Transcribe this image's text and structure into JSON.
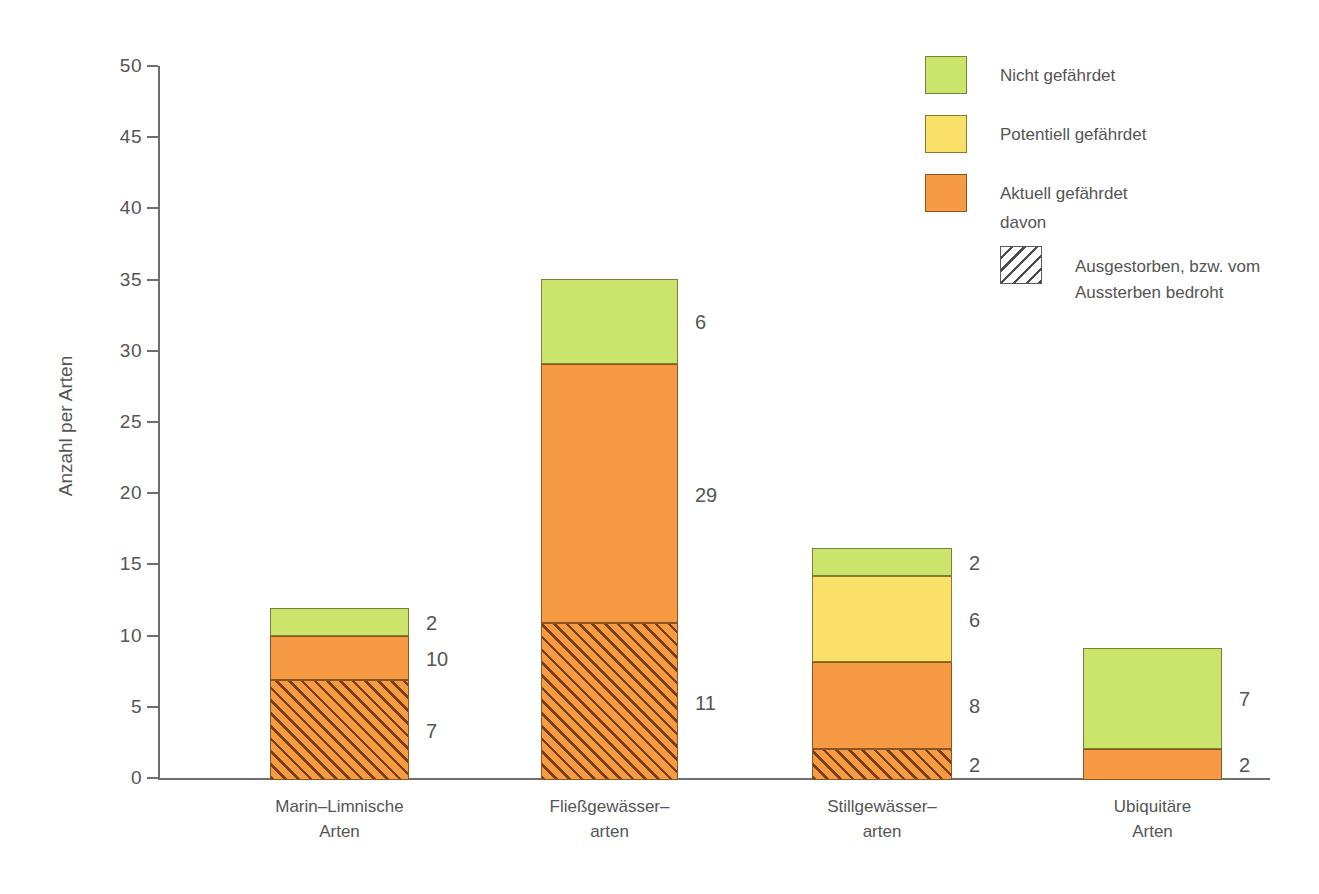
{
  "chart_data": {
    "type": "bar",
    "subtype": "stacked",
    "title": "",
    "xlabel": "",
    "ylabel": "Anzahl per Arten",
    "ylim": [
      0,
      50
    ],
    "ytick_step": 5,
    "yticks": [
      "50",
      "45",
      "40",
      "35",
      "30",
      "25",
      "20",
      "15",
      "10",
      "5",
      "0"
    ],
    "grid": false,
    "legend_position": "top-right",
    "categories": [
      "Marin–Limnische Arten",
      "Fließgewässer-arten",
      "Stillgewässer-arten",
      "Ubiquitäre Arten"
    ],
    "category_lines": [
      [
        "Marin–Limnische",
        "Arten"
      ],
      [
        "Fließgewässer–",
        "arten"
      ],
      [
        "Stillgewässer–",
        "arten"
      ],
      [
        "Ubiquitäre",
        "Arten"
      ]
    ],
    "series": [
      {
        "name": "Aktuell gefährdet, davon ausgestorben bzw. vom Aussterben bedroht",
        "key": "orange-hatched",
        "values": [
          7,
          11,
          2.2,
          0
        ]
      },
      {
        "name": "Aktuell gefährdet",
        "key": "orange",
        "values": [
          3.1,
          18.2,
          6.1,
          2.2
        ]
      },
      {
        "name": "Potentiell gefährdet",
        "key": "yellow",
        "values": [
          0,
          0,
          6.0,
          0
        ]
      },
      {
        "name": "Nicht gefährdet",
        "key": "green",
        "values": [
          2.0,
          6.0,
          2.0,
          7.1
        ]
      }
    ],
    "totals": [
      12.1,
      35.2,
      16.3,
      9.3
    ],
    "bars": [
      {
        "category": "Marin–Limnische Arten",
        "segments": [
          {
            "style": "orange-hatched",
            "from": 0,
            "to": 7,
            "label": "7"
          },
          {
            "style": "orange",
            "from": 7,
            "to": 10.1,
            "label": "10"
          },
          {
            "style": "green",
            "from": 10.1,
            "to": 12.1,
            "label": "2"
          }
        ]
      },
      {
        "category": "Fließgewässerarten",
        "segments": [
          {
            "style": "orange-hatched",
            "from": 0,
            "to": 11,
            "label": "11"
          },
          {
            "style": "orange",
            "from": 11,
            "to": 29.2,
            "label": "29"
          },
          {
            "style": "green",
            "from": 29.2,
            "to": 35.2,
            "label": "6"
          }
        ]
      },
      {
        "category": "Stillgewässerarten",
        "segments": [
          {
            "style": "orange-hatched",
            "from": 0,
            "to": 2.2,
            "label": "2"
          },
          {
            "style": "orange",
            "from": 2.2,
            "to": 8.3,
            "label": "8"
          },
          {
            "style": "yellow",
            "from": 8.3,
            "to": 14.3,
            "label": "6"
          },
          {
            "style": "green",
            "from": 14.3,
            "to": 16.3,
            "label": "2"
          }
        ]
      },
      {
        "category": "Ubiquitäre Arten",
        "segments": [
          {
            "style": "orange",
            "from": 0,
            "to": 2.2,
            "label": "2"
          },
          {
            "style": "green",
            "from": 2.2,
            "to": 9.3,
            "label": "7"
          }
        ]
      }
    ],
    "colors": {
      "green": "#cbe46c",
      "yellow": "#f9e069",
      "orange": "#f79a44",
      "hatch": "#7a3f12",
      "axis": "#6e6e6e",
      "text": "#555555"
    }
  },
  "axis": {
    "y_title": "Anzahl per Arten"
  },
  "legend": {
    "items": [
      {
        "swatch": "green",
        "label": "Nicht gefährdet"
      },
      {
        "swatch": "yellow",
        "label": "Potentiell gefährdet"
      },
      {
        "swatch": "orange",
        "label": "Aktuell gefährdet"
      }
    ],
    "davon": "davon",
    "hatched": {
      "swatch": "hatched",
      "line1": "Ausgestorben, bzw. vom",
      "line2": "Aussterben bedroht"
    }
  }
}
